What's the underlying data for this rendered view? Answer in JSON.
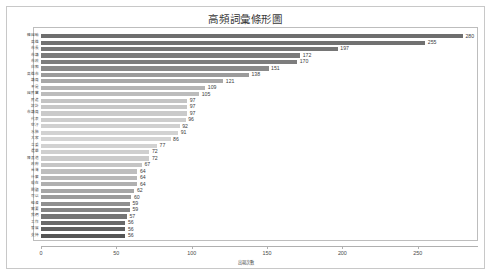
{
  "chart_data": {
    "type": "bar",
    "orientation": "horizontal",
    "title": "高頻詞彙條形圖",
    "xlabel": "出現次數",
    "ylabel": "",
    "xlim": [
      0,
      290
    ],
    "grid": false,
    "legend": false,
    "xticks": [
      0,
      50,
      100,
      150,
      200,
      250
    ],
    "xtick_labels": [
      "0",
      "50",
      "100",
      "150",
      "200",
      "250"
    ],
    "categories": [
      "韓國瑜",
      "高雄",
      "市長",
      "市議",
      "市政",
      "白痴",
      "高雄市",
      "議員",
      "不是",
      "國民黨",
      "民進",
      "設計",
      "市議員",
      "代表",
      "空汙",
      "水肺",
      "大家",
      "立委",
      "選舉",
      "陳其邁",
      "政府",
      "台灣",
      "什麼",
      "現在",
      "問題",
      "可以",
      "經濟",
      "需要",
      "我們",
      "工作",
      "發展",
      "支持"
    ],
    "values": [
      280,
      255,
      197,
      172,
      170,
      151,
      138,
      121,
      109,
      105,
      97,
      97,
      97,
      96,
      92,
      91,
      86,
      77,
      72,
      72,
      67,
      64,
      64,
      64,
      62,
      60,
      59,
      59,
      57,
      56,
      56,
      56
    ],
    "bar_shades": [
      "#6e6e6e",
      "#717171",
      "#767676",
      "#7a7a7a",
      "#7d7d7d",
      "#8a8a8a",
      "#9b9b9b",
      "#a8a8a8",
      "#b4b4b4",
      "#bcbcbc",
      "#c4c4c4",
      "#c7c7c7",
      "#cacaca",
      "#cdcdcd",
      "#d0d0d0",
      "#d2d2d2",
      "#d4d4d4",
      "#d2d2d2",
      "#cfcfcf",
      "#cbcbcb",
      "#c5c5c5",
      "#bebebe",
      "#b8b8b8",
      "#b0b0b0",
      "#a6a6a6",
      "#9b9b9b",
      "#8f8f8f",
      "#848484",
      "#757575",
      "#696969",
      "#5f5f5f",
      "#555555"
    ]
  }
}
